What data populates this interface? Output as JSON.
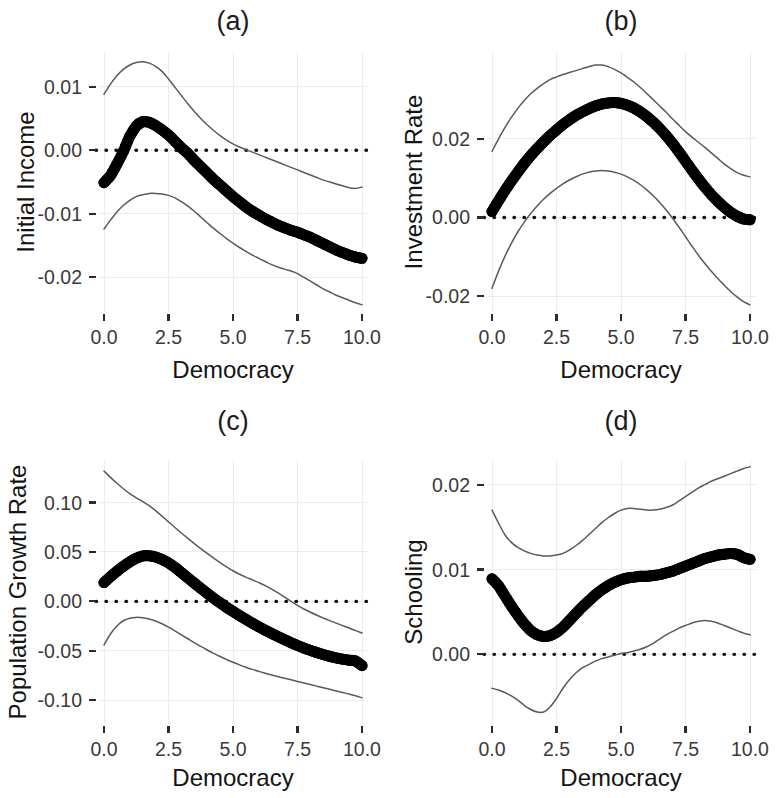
{
  "figure": {
    "x_axis_label": "Democracy",
    "x_ticks": [
      "0.0",
      "2.5",
      "5.0",
      "7.5",
      "10.0"
    ],
    "x_tick_values": [
      0,
      2.5,
      5,
      7.5,
      10
    ],
    "xlim": [
      0,
      10
    ]
  },
  "chart_data": [
    {
      "type": "line",
      "title": "(a)",
      "xlabel": "Democracy",
      "ylabel": "Initial Income",
      "xlim": [
        0,
        10
      ],
      "ylim": [
        -0.0245,
        0.0145
      ],
      "xticks": [
        0,
        2.5,
        5,
        7.5,
        10
      ],
      "xticklabels": [
        "0.0",
        "2.5",
        "5.0",
        "7.5",
        "10.0"
      ],
      "yticks": [
        0.01,
        0.0,
        -0.01,
        -0.02
      ],
      "yticklabels": [
        "0.01",
        "0.00",
        "-0.01",
        "-0.02"
      ],
      "grid": true,
      "zero_reference_line": 0.0,
      "x": [
        0.0,
        0.25,
        0.5,
        0.75,
        1.0,
        1.25,
        1.5,
        1.75,
        2.0,
        2.25,
        2.5,
        2.75,
        3.0,
        3.25,
        3.5,
        3.75,
        4.0,
        4.25,
        4.5,
        4.75,
        5.0,
        5.25,
        5.5,
        5.75,
        6.0,
        6.25,
        6.5,
        6.75,
        7.0,
        7.25,
        7.5,
        7.75,
        8.0,
        8.25,
        8.5,
        8.75,
        9.0,
        9.25,
        9.5,
        9.75,
        10.0
      ],
      "series": [
        {
          "name": "estimate",
          "style": "points",
          "values": [
            -0.0051,
            -0.004,
            -0.0022,
            -0.0002,
            0.0022,
            0.0038,
            0.0045,
            0.0044,
            0.0039,
            0.0032,
            0.0024,
            0.0014,
            0.0004,
            -0.0005,
            -0.0016,
            -0.0026,
            -0.0036,
            -0.0046,
            -0.0055,
            -0.0064,
            -0.0073,
            -0.0081,
            -0.0089,
            -0.0096,
            -0.0102,
            -0.0108,
            -0.0113,
            -0.0118,
            -0.0122,
            -0.0126,
            -0.0129,
            -0.0133,
            -0.0137,
            -0.0142,
            -0.0147,
            -0.0152,
            -0.0157,
            -0.0161,
            -0.0165,
            -0.0168,
            -0.017
          ]
        },
        {
          "name": "upper_ci",
          "style": "line",
          "values": [
            0.0088,
            0.0104,
            0.0117,
            0.0127,
            0.0134,
            0.0138,
            0.0139,
            0.0137,
            0.0132,
            0.0124,
            0.0112,
            0.0099,
            0.0086,
            0.0073,
            0.0061,
            0.005,
            0.004,
            0.0031,
            0.0023,
            0.0016,
            0.001,
            0.0005,
            0.0001,
            -0.0003,
            -0.0007,
            -0.0011,
            -0.0015,
            -0.0019,
            -0.0023,
            -0.0027,
            -0.0031,
            -0.0035,
            -0.0039,
            -0.0043,
            -0.0047,
            -0.005,
            -0.0053,
            -0.0056,
            -0.0059,
            -0.006,
            -0.0058
          ]
        },
        {
          "name": "lower_ci",
          "style": "line",
          "values": [
            -0.0124,
            -0.011,
            -0.0097,
            -0.0087,
            -0.0079,
            -0.0073,
            -0.007,
            -0.0068,
            -0.0068,
            -0.0069,
            -0.0071,
            -0.0075,
            -0.0081,
            -0.0088,
            -0.0096,
            -0.0105,
            -0.0114,
            -0.0123,
            -0.0131,
            -0.0139,
            -0.0146,
            -0.0153,
            -0.0159,
            -0.0165,
            -0.017,
            -0.0175,
            -0.018,
            -0.0184,
            -0.0187,
            -0.019,
            -0.0194,
            -0.02,
            -0.0206,
            -0.0212,
            -0.0218,
            -0.0223,
            -0.0228,
            -0.0232,
            -0.0236,
            -0.024,
            -0.0243
          ]
        }
      ]
    },
    {
      "type": "line",
      "title": "(b)",
      "xlabel": "Democracy",
      "ylabel": "Investment Rate",
      "xlim": [
        0,
        10
      ],
      "ylim": [
        -0.0225,
        0.0405
      ],
      "xticks": [
        0,
        2.5,
        5,
        7.5,
        10
      ],
      "xticklabels": [
        "0.0",
        "2.5",
        "5.0",
        "7.5",
        "10.0"
      ],
      "yticks": [
        0.02,
        0.0,
        -0.02
      ],
      "yticklabels": [
        "0.02",
        "0.00",
        "-0.02"
      ],
      "grid": true,
      "zero_reference_line": 0.0,
      "x": [
        0.0,
        0.25,
        0.5,
        0.75,
        1.0,
        1.25,
        1.5,
        1.75,
        2.0,
        2.25,
        2.5,
        2.75,
        3.0,
        3.25,
        3.5,
        3.75,
        4.0,
        4.25,
        4.5,
        4.75,
        5.0,
        5.25,
        5.5,
        5.75,
        6.0,
        6.25,
        6.5,
        6.75,
        7.0,
        7.25,
        7.5,
        7.75,
        8.0,
        8.25,
        8.5,
        8.75,
        9.0,
        9.25,
        9.5,
        9.75,
        10.0
      ],
      "series": [
        {
          "name": "estimate",
          "style": "points",
          "values": [
            0.0015,
            0.0042,
            0.0068,
            0.0092,
            0.0115,
            0.0137,
            0.0157,
            0.0175,
            0.0192,
            0.0208,
            0.0222,
            0.0236,
            0.0248,
            0.0259,
            0.0268,
            0.0276,
            0.0283,
            0.0288,
            0.0291,
            0.0292,
            0.029,
            0.0285,
            0.0278,
            0.0268,
            0.0256,
            0.0242,
            0.0226,
            0.0208,
            0.0188,
            0.0166,
            0.0143,
            0.012,
            0.0098,
            0.0077,
            0.0058,
            0.0041,
            0.0026,
            0.0013,
            0.0003,
            -0.0004,
            -0.0006
          ]
        },
        {
          "name": "upper_ci",
          "style": "line",
          "values": [
            0.0168,
            0.0199,
            0.0228,
            0.0254,
            0.0277,
            0.0297,
            0.0314,
            0.0328,
            0.034,
            0.035,
            0.0357,
            0.0363,
            0.0368,
            0.0373,
            0.0378,
            0.0383,
            0.0387,
            0.0387,
            0.0383,
            0.0376,
            0.0367,
            0.0356,
            0.0344,
            0.033,
            0.0315,
            0.0299,
            0.0283,
            0.0267,
            0.025,
            0.0234,
            0.0218,
            0.0204,
            0.0191,
            0.0178,
            0.0164,
            0.015,
            0.0136,
            0.0124,
            0.0114,
            0.0107,
            0.0103
          ]
        },
        {
          "name": "lower_ci",
          "style": "line",
          "values": [
            -0.018,
            -0.0137,
            -0.0099,
            -0.0066,
            -0.0037,
            -0.0012,
            0.001,
            0.0029,
            0.0046,
            0.0061,
            0.0074,
            0.0085,
            0.0095,
            0.0103,
            0.011,
            0.0115,
            0.0118,
            0.0119,
            0.0118,
            0.0115,
            0.011,
            0.0103,
            0.0094,
            0.0083,
            0.007,
            0.0055,
            0.0038,
            0.0019,
            -0.0002,
            -0.0025,
            -0.0049,
            -0.0073,
            -0.0096,
            -0.0117,
            -0.0137,
            -0.0155,
            -0.0172,
            -0.0188,
            -0.0202,
            -0.0214,
            -0.0222
          ]
        }
      ]
    },
    {
      "type": "line",
      "title": "(c)",
      "xlabel": "Democracy",
      "ylabel": "Population Growth Rate",
      "xlim": [
        0,
        10
      ],
      "ylim": [
        -0.118,
        0.137
      ],
      "xticks": [
        0,
        2.5,
        5,
        7.5,
        10
      ],
      "xticklabels": [
        "0.0",
        "2.5",
        "5.0",
        "7.5",
        "10.0"
      ],
      "yticks": [
        0.1,
        0.05,
        0.0,
        -0.05,
        -0.1
      ],
      "yticklabels": [
        "0.10",
        "0.05",
        "0.00",
        "-0.05",
        "-0.10"
      ],
      "grid": true,
      "zero_reference_line": 0.0,
      "x": [
        0.0,
        0.25,
        0.5,
        0.75,
        1.0,
        1.25,
        1.5,
        1.75,
        2.0,
        2.25,
        2.5,
        2.75,
        3.0,
        3.25,
        3.5,
        3.75,
        4.0,
        4.25,
        4.5,
        4.75,
        5.0,
        5.25,
        5.5,
        5.75,
        6.0,
        6.25,
        6.5,
        6.75,
        7.0,
        7.25,
        7.5,
        7.75,
        8.0,
        8.25,
        8.5,
        8.75,
        9.0,
        9.25,
        9.5,
        9.75,
        10.0
      ],
      "series": [
        {
          "name": "estimate",
          "style": "points",
          "values": [
            0.019,
            0.025,
            0.0305,
            0.0355,
            0.04,
            0.0437,
            0.046,
            0.0462,
            0.045,
            0.0425,
            0.039,
            0.0345,
            0.0292,
            0.0238,
            0.0185,
            0.0133,
            0.0082,
            0.0032,
            -0.0015,
            -0.006,
            -0.0102,
            -0.0143,
            -0.0182,
            -0.022,
            -0.0257,
            -0.0292,
            -0.0325,
            -0.0357,
            -0.0388,
            -0.0418,
            -0.0446,
            -0.0472,
            -0.0496,
            -0.0518,
            -0.0538,
            -0.0556,
            -0.0572,
            -0.0585,
            -0.0595,
            -0.0602,
            -0.065
          ]
        },
        {
          "name": "upper_ci",
          "style": "line",
          "values": [
            0.132,
            0.1255,
            0.1195,
            0.114,
            0.109,
            0.1048,
            0.101,
            0.0968,
            0.0918,
            0.0862,
            0.0805,
            0.0748,
            0.0692,
            0.0638,
            0.0585,
            0.0534,
            0.0485,
            0.0438,
            0.0393,
            0.035,
            0.031,
            0.0275,
            0.0245,
            0.0218,
            0.019,
            0.016,
            0.0125,
            0.0085,
            0.0042,
            0.0,
            -0.004,
            -0.0077,
            -0.011,
            -0.014,
            -0.0168,
            -0.0195,
            -0.022,
            -0.0245,
            -0.027,
            -0.0296,
            -0.032
          ]
        },
        {
          "name": "lower_ci",
          "style": "line",
          "values": [
            -0.044,
            -0.033,
            -0.0248,
            -0.0196,
            -0.017,
            -0.0162,
            -0.0165,
            -0.0178,
            -0.0198,
            -0.0226,
            -0.026,
            -0.0298,
            -0.0338,
            -0.0378,
            -0.0418,
            -0.0456,
            -0.0492,
            -0.0526,
            -0.0558,
            -0.0588,
            -0.0616,
            -0.0642,
            -0.0666,
            -0.0688,
            -0.0708,
            -0.0727,
            -0.0745,
            -0.0762,
            -0.0778,
            -0.0794,
            -0.081,
            -0.0826,
            -0.0842,
            -0.0858,
            -0.0874,
            -0.089,
            -0.0906,
            -0.0922,
            -0.0938,
            -0.0955,
            -0.0975
          ]
        }
      ]
    },
    {
      "type": "line",
      "title": "(d)",
      "xlabel": "Democracy",
      "ylabel": "Schooling",
      "xlim": [
        0,
        10
      ],
      "ylim": [
        -0.0075,
        0.0222
      ],
      "xticks": [
        0,
        2.5,
        5,
        7.5,
        10
      ],
      "xticklabels": [
        "0.0",
        "2.5",
        "5.0",
        "7.5",
        "10.0"
      ],
      "yticks": [
        0.02,
        0.01,
        0.0
      ],
      "yticklabels": [
        "0.02",
        "0.01",
        "0.00"
      ],
      "grid": true,
      "zero_reference_line": 0.0,
      "x": [
        0.0,
        0.25,
        0.5,
        0.75,
        1.0,
        1.25,
        1.5,
        1.75,
        2.0,
        2.25,
        2.5,
        2.75,
        3.0,
        3.25,
        3.5,
        3.75,
        4.0,
        4.25,
        4.5,
        4.75,
        5.0,
        5.25,
        5.5,
        5.75,
        6.0,
        6.25,
        6.5,
        6.75,
        7.0,
        7.25,
        7.5,
        7.75,
        8.0,
        8.25,
        8.5,
        8.75,
        9.0,
        9.25,
        9.5,
        9.75,
        10.0
      ],
      "series": [
        {
          "name": "estimate",
          "style": "points",
          "values": [
            0.0089,
            0.0081,
            0.0069,
            0.0057,
            0.0046,
            0.0036,
            0.0028,
            0.0023,
            0.0021,
            0.0022,
            0.0026,
            0.0032,
            0.004,
            0.0048,
            0.0056,
            0.0063,
            0.007,
            0.0076,
            0.0081,
            0.0085,
            0.0088,
            0.009,
            0.0091,
            0.0092,
            0.0092,
            0.0093,
            0.0094,
            0.0096,
            0.0098,
            0.0101,
            0.0104,
            0.0107,
            0.011,
            0.0113,
            0.0115,
            0.0117,
            0.0118,
            0.0119,
            0.0118,
            0.0114,
            0.0112
          ]
        },
        {
          "name": "upper_ci",
          "style": "line",
          "values": [
            0.017,
            0.0155,
            0.0141,
            0.0132,
            0.0126,
            0.0122,
            0.0119,
            0.0117,
            0.0116,
            0.0116,
            0.0117,
            0.0119,
            0.0123,
            0.0128,
            0.0134,
            0.0141,
            0.0148,
            0.0155,
            0.0161,
            0.0166,
            0.017,
            0.0172,
            0.0172,
            0.0171,
            0.017,
            0.017,
            0.0171,
            0.0173,
            0.0176,
            0.0181,
            0.0186,
            0.0191,
            0.0196,
            0.02,
            0.0204,
            0.0207,
            0.021,
            0.0213,
            0.0216,
            0.0219,
            0.0221
          ]
        },
        {
          "name": "lower_ci",
          "style": "line",
          "values": [
            -0.004,
            -0.0042,
            -0.0045,
            -0.0049,
            -0.0054,
            -0.006,
            -0.0065,
            -0.0068,
            -0.0068,
            -0.0062,
            -0.0052,
            -0.004,
            -0.003,
            -0.0022,
            -0.0016,
            -0.0012,
            -0.0008,
            -0.0005,
            -0.0003,
            -0.0001,
            0.0001,
            0.0002,
            0.0004,
            0.0006,
            0.0009,
            0.0013,
            0.0018,
            0.0023,
            0.0027,
            0.0031,
            0.0034,
            0.0037,
            0.0039,
            0.004,
            0.0039,
            0.0037,
            0.0034,
            0.0031,
            0.0028,
            0.0025,
            0.0023
          ]
        }
      ]
    }
  ]
}
